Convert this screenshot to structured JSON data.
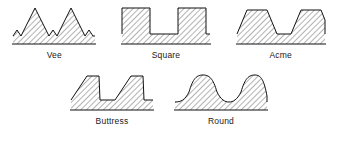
{
  "figure": {
    "background_color": "#ffffff",
    "line_color": "#111111",
    "hatch_color": "#555555",
    "label_color": "#1a1a1a"
  },
  "rows": [
    {
      "name": "top-row",
      "profiles": [
        {
          "id": "vee",
          "label": "Vee",
          "shape": "triangular pointed teeth with vee roots",
          "teeth": 2,
          "crest": "pointed",
          "root": "vee",
          "flank_angle_deg": 60,
          "symmetry": "symmetric"
        },
        {
          "id": "square",
          "label": "Square",
          "shape": "rectangular teeth with flat crests and flat roots",
          "teeth": 2,
          "crest": "flat",
          "root": "flat",
          "flank_angle_deg": 0,
          "symmetry": "symmetric"
        },
        {
          "id": "acme",
          "label": "Acme",
          "shape": "trapezoidal teeth with sloping flanks",
          "teeth": 2,
          "crest": "flat",
          "root": "flat",
          "flank_angle_deg": 29,
          "symmetry": "symmetric"
        }
      ]
    },
    {
      "name": "bottom-row",
      "profiles": [
        {
          "id": "buttress",
          "label": "Buttress",
          "shape": "asymmetric teeth, one sloped flank and one near-vertical flank",
          "teeth": 2,
          "crest": "flat",
          "root": "flat",
          "flank_angle_deg": 45,
          "symmetry": "asymmetric"
        },
        {
          "id": "round",
          "label": "Round",
          "shape": "rounded sinusoidal crests and roots",
          "teeth": 2,
          "crest": "rounded",
          "root": "rounded",
          "flank_angle_deg": 0,
          "symmetry": "symmetric"
        }
      ]
    }
  ]
}
